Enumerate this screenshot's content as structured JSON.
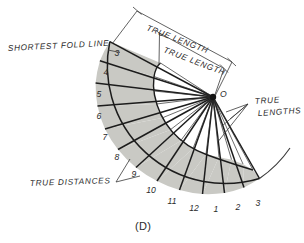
{
  "figure": {
    "caption": "(D)",
    "apex_label": "O",
    "annotations": [
      {
        "name": "shortest-fold-line",
        "text": "SHORTEST FOLD LINE",
        "x": 8,
        "y": 48
      },
      {
        "name": "true-length-outer",
        "text": "TRUE LENGTH",
        "x": 152,
        "y": 24
      },
      {
        "name": "true-length-inner",
        "text": "TRUE LENGTH",
        "x": 170,
        "y": 48
      },
      {
        "name": "true-lengths",
        "text": "TRUE",
        "text2": "LENGTHS",
        "x": 258,
        "y": 105
      },
      {
        "name": "true-distances",
        "text": "TRUE DISTANCES",
        "x": 30,
        "y": 185
      }
    ],
    "station_numbers": [
      {
        "label": "3",
        "x": 120,
        "y": 53
      },
      {
        "label": "4",
        "x": 109,
        "y": 72
      },
      {
        "label": "5",
        "x": 102,
        "y": 94
      },
      {
        "label": "6",
        "x": 101,
        "y": 116
      },
      {
        "label": "7",
        "x": 107,
        "y": 137
      },
      {
        "label": "8",
        "x": 119,
        "y": 157
      },
      {
        "label": "9",
        "x": 136,
        "y": 174
      },
      {
        "label": "10",
        "x": 152,
        "y": 190
      },
      {
        "label": "11",
        "x": 172,
        "y": 201
      },
      {
        "label": "12",
        "x": 194,
        "y": 208
      },
      {
        "label": "1",
        "x": 215,
        "y": 209
      },
      {
        "label": "2",
        "x": 237,
        "y": 207
      },
      {
        "label": "3",
        "x": 257,
        "y": 203
      }
    ],
    "colors": {
      "fill": "#c9c9c4",
      "stroke": "#1c1c1c",
      "thin_stroke": "#3a3a3a",
      "background": "#ffffff"
    },
    "geometry": {
      "apex": {
        "x": 213,
        "y": 97
      },
      "outer_radius": 118,
      "inner_radius_min": 48,
      "inner_radius_max": 112,
      "start_angle_deg": 152,
      "end_angle_deg": 70,
      "divisions": 12
    }
  }
}
